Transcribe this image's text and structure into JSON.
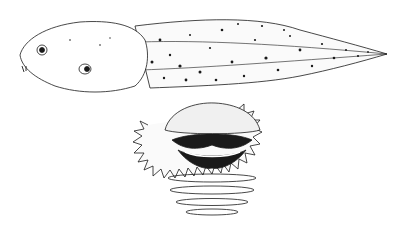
{
  "figure": {
    "panels": [
      {
        "id": "lateral-view",
        "subject": "tadpole body and tail, lateral view, stippled pigmentation"
      },
      {
        "id": "oral-disc",
        "subject": "tadpole oral disc with jaw sheaths, tooth rows and marginal papillae"
      }
    ],
    "colors": {
      "ink": "#1a1a1a",
      "background": "#ffffff",
      "shade": "#e8e8e8"
    }
  }
}
